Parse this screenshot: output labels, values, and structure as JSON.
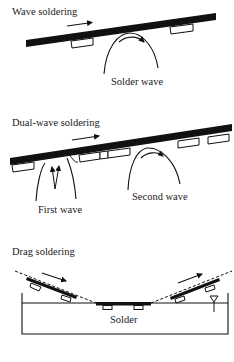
{
  "diagram": {
    "panels": [
      {
        "title": "Wave soldering",
        "labels": {
          "wave": "Solder wave"
        }
      },
      {
        "title": "Dual-wave soldering",
        "labels": {
          "first_wave": "First wave",
          "second_wave": "Second wave"
        }
      },
      {
        "title": "Drag soldering",
        "labels": {
          "bath": "Solder"
        }
      }
    ],
    "colors": {
      "ink": "#111111",
      "background": "#ffffff"
    }
  }
}
